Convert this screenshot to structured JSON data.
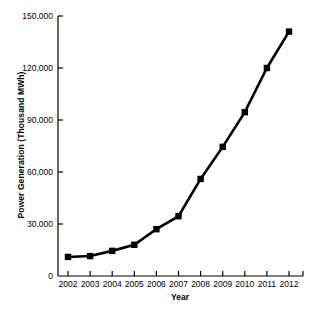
{
  "chart_data": {
    "type": "line",
    "title": "",
    "xlabel": "Year",
    "ylabel": "Power Generation (Thousand MWh)",
    "categories": [
      "2002",
      "2003",
      "2004",
      "2005",
      "2006",
      "2007",
      "2008",
      "2009",
      "2010",
      "2011",
      "2012"
    ],
    "x": [
      2002,
      2003,
      2004,
      2005,
      2006,
      2007,
      2008,
      2009,
      2010,
      2011,
      2012
    ],
    "values": [
      11000,
      11500,
      14500,
      18000,
      27000,
      34500,
      56000,
      74500,
      94500,
      120000,
      141000
    ],
    "series": [
      {
        "name": "Power Generation",
        "values": [
          11000,
          11500,
          14500,
          18000,
          27000,
          34500,
          56000,
          74500,
          94500,
          120000,
          141000
        ]
      }
    ],
    "ylim": [
      0,
      150000
    ],
    "xlim": [
      2002,
      2012
    ],
    "ytick_values": [
      0,
      30000,
      60000,
      90000,
      120000,
      150000
    ],
    "ytick_labels": [
      "0",
      "30,000",
      "60,000",
      "90,000",
      "120,000",
      "150,000"
    ],
    "xtick_labels": [
      "2002",
      "2003",
      "2004",
      "2005",
      "2006",
      "2007",
      "2008",
      "2009",
      "2010",
      "2011",
      "2012"
    ],
    "grid": false,
    "legend": false,
    "legend_position": "none",
    "marker": "square",
    "line_color": "#000000",
    "marker_color": "#000000",
    "background_color": "#ffffff",
    "axis_color": "#000000"
  }
}
